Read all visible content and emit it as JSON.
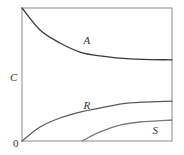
{
  "chart_data": {
    "type": "line",
    "title": "",
    "xlabel": "",
    "ylabel": "C",
    "origin_label": "0",
    "xlim": [
      0,
      1
    ],
    "ylim": [
      0,
      1
    ],
    "grid": false,
    "legend": "none (series labeled inline)",
    "series": [
      {
        "name": "A",
        "color": "#3a3a3a",
        "x": [
          0,
          0.12,
          0.253,
          0.387,
          0.52,
          0.72,
          1.0
        ],
        "y": [
          1.0,
          0.835,
          0.737,
          0.669,
          0.64,
          0.617,
          0.61
        ],
        "label_at": [
          0.41,
          0.73
        ]
      },
      {
        "name": "R",
        "color": "#5a5a5a",
        "x": [
          0,
          0.12,
          0.253,
          0.387,
          0.52,
          0.72,
          1.0
        ],
        "y": [
          0,
          0.105,
          0.173,
          0.218,
          0.248,
          0.286,
          0.3
        ],
        "label_at": [
          0.41,
          0.24
        ]
      },
      {
        "name": "S",
        "color": "#7a7a7a",
        "x": [
          0.4,
          0.52,
          0.653,
          0.787,
          1.0
        ],
        "y": [
          0,
          0.068,
          0.12,
          0.143,
          0.158
        ],
        "label_at": [
          0.87,
          0.05
        ]
      }
    ]
  }
}
